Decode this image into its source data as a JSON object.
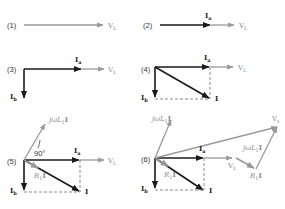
{
  "colors": {
    "dark_vector": "#1a1a1a",
    "grey_vector": "#999999",
    "dashed": "#8a8a8a",
    "text": "#222222"
  },
  "panels": [
    {
      "id": "1",
      "label": "(1)",
      "vectors": [
        "V_L"
      ]
    },
    {
      "id": "2",
      "label": "(2)",
      "vectors": [
        "I_a",
        "V_L"
      ]
    },
    {
      "id": "3",
      "label": "(3)",
      "vectors": [
        "I_a",
        "V_L",
        "I_b"
      ]
    },
    {
      "id": "4",
      "label": "(4)",
      "vectors": [
        "I_a",
        "V_L",
        "I_b",
        "I"
      ]
    },
    {
      "id": "5",
      "label": "(5)",
      "vectors": [
        "jωL1 I",
        "90°",
        "I_a",
        "V_L",
        "R1 I",
        "I_b",
        "I"
      ]
    },
    {
      "id": "6",
      "label": "(6)",
      "vectors": [
        "jωL1 I",
        "V_s",
        "I_a",
        "V_L",
        "jωL1 I",
        "R1 I",
        "R1 I",
        "I_b",
        "I"
      ]
    }
  ],
  "labels": {
    "p1": "(1)",
    "p2": "(2)",
    "p3": "(3)",
    "p4": "(4)",
    "p5": "(5)",
    "p6": "(6)",
    "VL": "V",
    "VL_sub": "L",
    "Ia": "I",
    "Ia_sub": "a",
    "Ib": "I",
    "Ib_sub": "b",
    "I": "I",
    "jwL": "jωL",
    "jwL_sub": "1",
    "jwL_I": "I",
    "R": "R",
    "R_sub": "1",
    "R_I": "I",
    "Vs": "V",
    "Vs_sub": "s",
    "angle": "90°"
  }
}
